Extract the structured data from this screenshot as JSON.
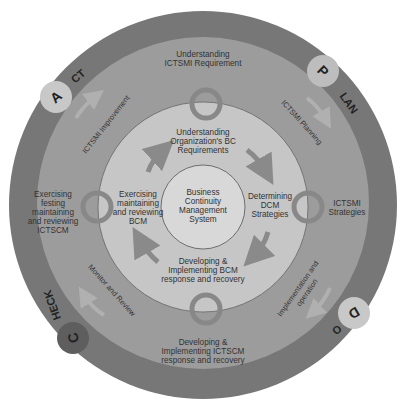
{
  "diagram": {
    "colors": {
      "outer_ring": "#777777",
      "middle_ring": "#9c9c9c",
      "inner_ring": "#c4c4c4",
      "center": "#d6d6d6",
      "plan_circle": "#bdbdbd",
      "do_circle": "#c8c8c8",
      "check_circle": "#5e5e5e",
      "act_circle": "#c8c8c8",
      "text": "#333333",
      "arrow": "#8a8a8a"
    },
    "center": {
      "line1": "Business",
      "line2": "Continuity",
      "line3": "Management",
      "line4": "System"
    },
    "inner_cycle": {
      "top": {
        "line1": "Understanding",
        "line2": "Organization's BC",
        "line3": "Requirements"
      },
      "right": {
        "line1": "Determining",
        "line2": "DCM",
        "line3": "Strategies"
      },
      "bottom": {
        "line1": "Developing &",
        "line2": "Implementing BCM",
        "line3": "response and recovery"
      },
      "left": {
        "line1": "Exercising",
        "line2": "maintaining",
        "line3": "and reviewing",
        "line4": "BCM"
      }
    },
    "middle_cycle": {
      "top": {
        "line1": "Understanding",
        "line2": "ICTSMI Requirement"
      },
      "right": {
        "line1": "ICTSMI",
        "line2": "Strategies"
      },
      "bottom": {
        "line1": "Developing &",
        "line2": "Implementing ICTSCM",
        "line3": "response and recovery"
      },
      "left": {
        "line1": "Exercising",
        "line2": "festing",
        "line3": "maintaining",
        "line4": "and reviewing",
        "line5": "ICTSCM"
      },
      "transitions": {
        "top_right": "ICTSMI Planning",
        "bottom_right_1": "Implementation and",
        "bottom_right_2": "operation",
        "bottom_left": "Monitor and Review",
        "top_left": "ICTSMI Improvement"
      }
    },
    "pdca": {
      "plan_letter": "P",
      "plan_rest": "LAN",
      "do_letter": "D",
      "do_rest": "O",
      "check_letter": "C",
      "check_rest": "HECK",
      "act_letter": "A",
      "act_rest": "CT"
    }
  }
}
